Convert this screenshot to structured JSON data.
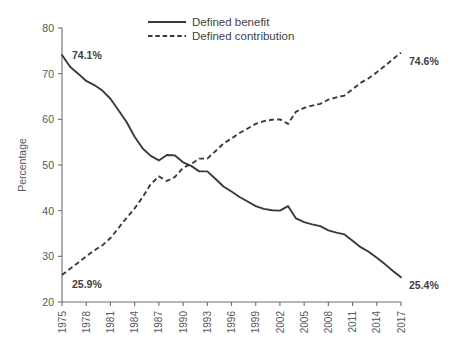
{
  "chart_data": {
    "type": "line",
    "title": "",
    "xlabel": "",
    "ylabel": "Percentage",
    "xlim": [
      1975,
      2017
    ],
    "ylim": [
      20,
      80
    ],
    "yticks": [
      20,
      30,
      40,
      50,
      60,
      70,
      80
    ],
    "xticks": [
      1975,
      1978,
      1981,
      1984,
      1987,
      1990,
      1993,
      1996,
      1999,
      2002,
      2005,
      2008,
      2011,
      2014,
      2017
    ],
    "grid": false,
    "legend_position": "top-center",
    "x": [
      1975,
      1976,
      1977,
      1978,
      1979,
      1980,
      1981,
      1982,
      1983,
      1984,
      1985,
      1986,
      1987,
      1988,
      1989,
      1990,
      1991,
      1992,
      1993,
      1994,
      1995,
      1996,
      1997,
      1998,
      1999,
      2000,
      2001,
      2002,
      2003,
      2004,
      2005,
      2006,
      2007,
      2008,
      2009,
      2010,
      2011,
      2012,
      2013,
      2014,
      2015,
      2016,
      2017
    ],
    "series": [
      {
        "name": "Defined benefit",
        "style": "solid",
        "color": "#3a3a3c",
        "values": [
          74.1,
          71.5,
          70.0,
          68.4,
          67.5,
          66.3,
          64.5,
          62.0,
          59.4,
          56.2,
          53.6,
          52.0,
          51.0,
          52.2,
          52.1,
          50.6,
          49.8,
          48.6,
          48.6,
          47.0,
          45.3,
          44.2,
          43.0,
          42.0,
          41.0,
          40.4,
          40.1,
          40.0,
          41.0,
          38.3,
          37.5,
          37.0,
          36.6,
          35.7,
          35.2,
          34.8,
          33.4,
          32.0,
          31.0,
          29.7,
          28.3,
          26.8,
          25.4
        ]
      },
      {
        "name": "Defined contribution",
        "style": "dashed",
        "color": "#3a3a3c",
        "values": [
          25.9,
          27.3,
          28.6,
          30.0,
          31.3,
          32.4,
          34.0,
          36.2,
          38.4,
          40.5,
          43.0,
          45.8,
          47.5,
          46.5,
          47.4,
          49.4,
          50.2,
          51.4,
          51.4,
          53.0,
          54.7,
          55.8,
          57.0,
          58.0,
          59.0,
          59.6,
          59.9,
          60.0,
          59.0,
          61.7,
          62.5,
          63.0,
          63.4,
          64.3,
          64.8,
          65.2,
          66.6,
          68.0,
          69.0,
          70.3,
          71.7,
          73.2,
          74.6
        ]
      }
    ],
    "annotations": [
      {
        "text": "74.1%",
        "series": "Defined benefit",
        "x": 1975,
        "y": 74.1,
        "position": "right"
      },
      {
        "text": "74.6%",
        "series": "Defined contribution",
        "x": 2017,
        "y": 74.6,
        "position": "right"
      },
      {
        "text": "25.9%",
        "series": "Defined contribution",
        "x": 1975,
        "y": 25.9,
        "position": "right"
      },
      {
        "text": "25.4%",
        "series": "Defined benefit",
        "x": 2017,
        "y": 25.4,
        "position": "right"
      }
    ]
  },
  "legend": {
    "entries": [
      {
        "label": "Defined benefit",
        "style": "solid"
      },
      {
        "label": "Defined contribution",
        "style": "dashed"
      }
    ]
  },
  "axes": {
    "y_title": "Percentage",
    "y_tick_labels": [
      "80",
      "70",
      "60",
      "50",
      "40",
      "30",
      "20"
    ],
    "x_tick_labels": [
      "1975",
      "1978",
      "1981",
      "1984",
      "1987",
      "1990",
      "1993",
      "1996",
      "1999",
      "2002",
      "2005",
      "2008",
      "2011",
      "2014",
      "2017"
    ]
  },
  "annotation_labels": {
    "top_left": "74.1%",
    "top_right": "74.6%",
    "bottom_left": "25.9%",
    "bottom_right": "25.4%"
  },
  "colors": {
    "line": "#3a3a3c",
    "axis": "#6e6e70",
    "text": "#58585a",
    "background": "#ffffff"
  }
}
